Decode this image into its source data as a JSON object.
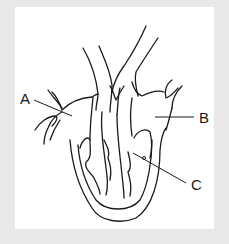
{
  "diagram": {
    "labels": [
      {
        "id": "A",
        "text": "A"
      },
      {
        "id": "B",
        "text": "B"
      },
      {
        "id": "C",
        "text": "C"
      }
    ]
  },
  "colors": {
    "background": "#e9e9e9",
    "panel": "#ffffff",
    "line": "#1a1a1a"
  }
}
